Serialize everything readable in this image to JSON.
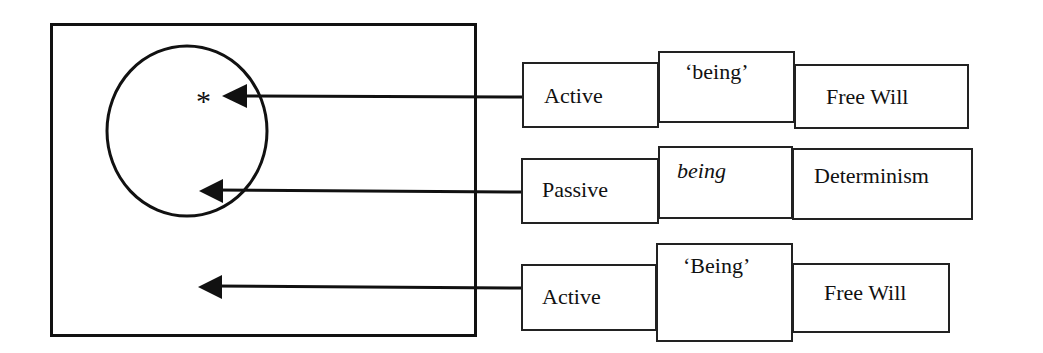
{
  "diagram": {
    "outer_box": {
      "label": ""
    },
    "circle": {
      "marker": "*"
    },
    "rows": [
      {
        "cells": [
          {
            "text": "Active",
            "style": "normal"
          },
          {
            "text": "‘being’",
            "style": "normal"
          },
          {
            "text": "Free Will",
            "style": "normal"
          }
        ],
        "arrow_target": "asterisk inside circle"
      },
      {
        "cells": [
          {
            "text": "Passive",
            "style": "normal"
          },
          {
            "text": "being",
            "style": "italic"
          },
          {
            "text": "Determinism",
            "style": "normal"
          }
        ],
        "arrow_target": "circle boundary (lower)"
      },
      {
        "cells": [
          {
            "text": "Active",
            "style": "normal"
          },
          {
            "text": "‘Being’",
            "style": "normal"
          },
          {
            "text": "Free Will",
            "style": "normal"
          }
        ],
        "arrow_target": "outer box, outside circle"
      }
    ]
  },
  "colors": {
    "line": "#111111",
    "background": "#ffffff"
  }
}
